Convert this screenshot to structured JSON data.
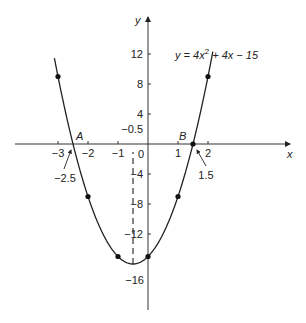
{
  "chart_data": {
    "type": "line",
    "title": "",
    "equation": "y = 4x² + 4x − 15",
    "equation_parts": {
      "a": "y = 4x",
      "sup": "2",
      "b": " + 4x − 15"
    },
    "xlabel": "x",
    "ylabel": "y",
    "xlim": [
      -4.4,
      4.0
    ],
    "ylim": [
      -19,
      18
    ],
    "x_ticks": [
      -3,
      -2,
      -1,
      1,
      2
    ],
    "x_tick_labels": [
      "−3",
      "−2",
      "−1",
      "1",
      "2"
    ],
    "y_ticks": [
      12,
      8,
      4,
      -4,
      -8,
      -12
    ],
    "y_tick_labels": [
      "12",
      "8",
      "4",
      "−4",
      "−8",
      "−12"
    ],
    "origin_label": "0",
    "grid": false,
    "points": [
      {
        "x": -3,
        "y": 9
      },
      {
        "x": -2,
        "y": -7
      },
      {
        "x": -1,
        "y": -15
      },
      {
        "x": 0,
        "y": -15
      },
      {
        "x": 1,
        "y": -7
      },
      {
        "x": 1.5,
        "y": 0
      },
      {
        "x": 2,
        "y": 9
      }
    ],
    "annotations": {
      "A": {
        "label": "A",
        "x": -2.5,
        "y": 0,
        "arrow_label": "−2.5"
      },
      "B": {
        "label": "B",
        "x": 1.5,
        "y": 0,
        "arrow_label": "1.5"
      },
      "minimum": {
        "x": -0.5,
        "y": -16,
        "x_label": "−0.5",
        "y_label": "−16"
      }
    }
  }
}
